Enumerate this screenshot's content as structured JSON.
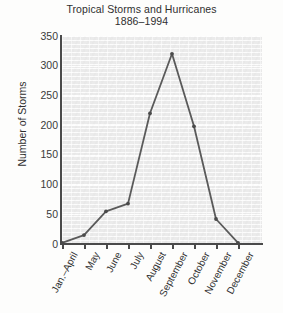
{
  "chart_data": {
    "type": "line",
    "title": "Tropical Storms and Hurricanes",
    "subtitle": "1886–1994",
    "xlabel": "",
    "ylabel": "Number of Storms",
    "categories": [
      "Jan.–April",
      "May",
      "June",
      "July",
      "August",
      "September",
      "October",
      "November",
      "December"
    ],
    "values": [
      2,
      15,
      55,
      68,
      220,
      320,
      198,
      42,
      2
    ],
    "series": [
      {
        "name": "Number of Storms",
        "values": [
          2,
          15,
          55,
          68,
          220,
          320,
          198,
          42,
          2
        ]
      }
    ],
    "ylim": [
      0,
      350
    ],
    "yticks": [
      0,
      50,
      100,
      150,
      200,
      250,
      300,
      350
    ],
    "ytick_labels": [
      "0",
      "50",
      "100",
      "150",
      "200",
      "250",
      "300",
      "350"
    ],
    "grid": true,
    "legend": "none",
    "line_color": "#5a5a5a",
    "marker_color": "#4a4a4a",
    "plot_background": "#ebebeb"
  },
  "axis": {
    "y_title": "Number of Storms"
  },
  "ticks": {
    "t0": "0",
    "t50": "50",
    "t100": "100",
    "t150": "150",
    "t200": "200",
    "t250": "250",
    "t300": "300",
    "t350": "350"
  },
  "xlabels": {
    "c0": "Jan.–April",
    "c1": "May",
    "c2": "June",
    "c3": "July",
    "c4": "August",
    "c5": "September",
    "c6": "October",
    "c7": "November",
    "c8": "December"
  },
  "title": {
    "main": "Tropical Storms and Hurricanes",
    "sub": "1886–1994"
  }
}
